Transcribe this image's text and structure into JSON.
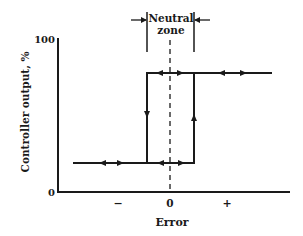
{
  "diagram": {
    "y_axis": {
      "label": "Controller output, %",
      "ticks": [
        {
          "label": "0",
          "value": 0
        },
        {
          "label": "100",
          "value": 100
        }
      ]
    },
    "x_axis": {
      "label": "Error",
      "ticks": [
        {
          "label": "−",
          "position": "negative"
        },
        {
          "label": "0",
          "position": "zero"
        },
        {
          "label": "+",
          "position": "positive"
        }
      ]
    },
    "neutral_zone": {
      "label_line1": "Neutral",
      "label_line2": "zone"
    },
    "colors": {
      "line": "#1a1a1a",
      "background": "#ffffff"
    },
    "curve": {
      "low_output_level": "low",
      "high_output_level": "high",
      "switch_down_at": "left edge of neutral zone",
      "switch_up_at": "right edge of neutral zone"
    }
  }
}
